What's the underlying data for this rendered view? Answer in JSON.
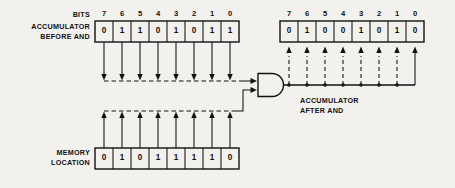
{
  "diagram": {
    "background_color": "#f2f1ed",
    "ink_color": "#121212"
  },
  "labels": {
    "bits": "BITS",
    "accumulator_before": "ACCUMULATOR\nBEFORE AND",
    "accumulator_after": "ACCUMULATOR\nAFTER AND",
    "memory_location": "MEMORY\nLOCATION"
  },
  "bit_numbers": [
    "7",
    "6",
    "5",
    "4",
    "3",
    "2",
    "1",
    "0"
  ],
  "registers": {
    "accumulator_before": {
      "name": "ACCUMULATOR BEFORE AND",
      "bits": [
        "0",
        "1",
        "1",
        "0",
        "1",
        "0",
        "1",
        "1"
      ]
    },
    "memory_location": {
      "name": "MEMORY LOCATION",
      "bits": [
        "0",
        "1",
        "0",
        "1",
        "1",
        "1",
        "1",
        "0"
      ]
    },
    "accumulator_after": {
      "name": "ACCUMULATOR AFTER AND",
      "bits": [
        "0",
        "1",
        "0",
        "0",
        "1",
        "0",
        "1",
        "0"
      ]
    }
  },
  "gate": {
    "type": "AND",
    "inputs": 2,
    "outputs": 1
  }
}
